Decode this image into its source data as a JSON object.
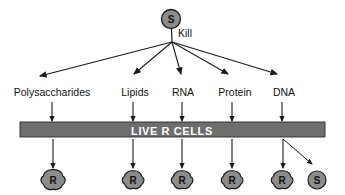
{
  "diagram": {
    "colors": {
      "cell_fill": "#8c8c8c",
      "cell_stroke": "#1a1a1a",
      "bar_fill": "#6e6e6e",
      "bar_stroke": "#2b2b2b",
      "bar_text": "#ffffff",
      "line": "#1a1a1a",
      "background": "#ffffff",
      "text": "#111111"
    },
    "source_cell": {
      "letter": "S",
      "cx": 171,
      "cy": 19,
      "r": 9.5
    },
    "kill_label": {
      "text": "Kill",
      "x": 178,
      "y": 37
    },
    "fan_origin": {
      "x": 172,
      "y": 42
    },
    "components": [
      {
        "label": "Polysaccharides",
        "label_x": 52,
        "label_y": 92,
        "arrow_end_x": 38,
        "arrow_end_y": 78,
        "tick_x": 52,
        "result": "R"
      },
      {
        "label": "Lipids",
        "label_x": 135,
        "label_y": 92,
        "arrow_end_x": 133,
        "arrow_end_y": 78,
        "tick_x": 133,
        "result": "R"
      },
      {
        "label": "RNA",
        "label_x": 183,
        "label_y": 92,
        "arrow_end_x": 182,
        "arrow_end_y": 78,
        "tick_x": 182,
        "result": "R"
      },
      {
        "label": "Protein",
        "label_x": 235,
        "label_y": 92,
        "arrow_end_x": 232,
        "arrow_end_y": 78,
        "tick_x": 232,
        "result": "R"
      },
      {
        "label": "DNA",
        "label_x": 284,
        "label_y": 92,
        "arrow_end_x": 282,
        "arrow_end_y": 78,
        "tick_x": 282,
        "result": "R"
      }
    ],
    "bar": {
      "text": "LIVE R CELLS",
      "x": 20,
      "y": 122,
      "width": 305,
      "height": 15
    },
    "results": [
      {
        "letter": "R",
        "cx": 53,
        "cy": 180,
        "r": 10,
        "shape": "rough"
      },
      {
        "letter": "R",
        "cx": 133,
        "cy": 180,
        "r": 9,
        "shape": "rough"
      },
      {
        "letter": "R",
        "cx": 182,
        "cy": 180,
        "r": 9,
        "shape": "rough"
      },
      {
        "letter": "R",
        "cx": 232,
        "cy": 180,
        "r": 9,
        "shape": "rough"
      },
      {
        "letter": "R",
        "cx": 282,
        "cy": 180,
        "r": 9,
        "shape": "rough"
      },
      {
        "letter": "S",
        "cx": 317,
        "cy": 180,
        "r": 9,
        "shape": "smooth"
      }
    ],
    "transformation_arrow": {
      "from_x": 283,
      "from_y": 139,
      "to_x": 315,
      "to_y": 165
    }
  }
}
